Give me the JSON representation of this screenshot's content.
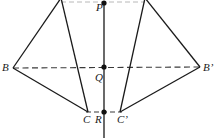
{
  "figure": {
    "type": "geometry-diagram",
    "width": 217,
    "height": 138,
    "background_color": "#ffffff",
    "stroke_color": "#1a1a1a",
    "dashed_color": "#3a3a3a",
    "faint_dashed_color": "#b8b8b8",
    "points": [
      {
        "name": "P",
        "label": "P",
        "x": 104,
        "y": 3,
        "marker": "filled-dot",
        "label_dx": -8,
        "label_dy": 0
      },
      {
        "name": "Q",
        "label": "Q",
        "x": 104,
        "y": 67,
        "marker": "filled-dot",
        "label_dx": -9,
        "label_dy": 6
      },
      {
        "name": "R",
        "label": "R",
        "x": 104,
        "y": 112,
        "marker": "filled-dot",
        "label_dx": -9,
        "label_dy": 3
      },
      {
        "name": "B",
        "label": "B",
        "x": 13,
        "y": 68,
        "marker": "none",
        "label_dx": -11,
        "label_dy": -5
      },
      {
        "name": "Bp",
        "label": "B’",
        "x": 200,
        "y": 67,
        "marker": "none",
        "label_dx": 4,
        "label_dy": -5
      },
      {
        "name": "C",
        "label": "C",
        "x": 88,
        "y": 112,
        "marker": "none",
        "label_dx": -5,
        "label_dy": 3
      },
      {
        "name": "Cp",
        "label": "C’",
        "x": 120,
        "y": 112,
        "marker": "none",
        "label_dx": -2,
        "label_dy": 3
      },
      {
        "name": "A",
        "label": "",
        "x": 61,
        "y": -2,
        "marker": "none",
        "label_dx": 0,
        "label_dy": 0
      },
      {
        "name": "Ap",
        "label": "",
        "x": 145,
        "y": -2,
        "marker": "none",
        "label_dx": 0,
        "label_dy": 0
      }
    ],
    "solid_segments": [
      {
        "name": "apex-left-to-B",
        "x1": 61,
        "y1": -2,
        "x2": 13,
        "y2": 68
      },
      {
        "name": "B-to-C",
        "x1": 13,
        "y1": 68,
        "x2": 88,
        "y2": 112
      },
      {
        "name": "C-to-apex-left",
        "x1": 88,
        "y1": 112,
        "x2": 61,
        "y2": -2
      },
      {
        "name": "apex-right-to-Bp",
        "x1": 145,
        "y1": -2,
        "x2": 200,
        "y2": 67
      },
      {
        "name": "Bp-to-Cp",
        "x1": 200,
        "y1": 67,
        "x2": 120,
        "y2": 112
      },
      {
        "name": "Cp-to-apex-right",
        "x1": 120,
        "y1": 112,
        "x2": 145,
        "y2": -2
      },
      {
        "name": "vertical-axis-PR",
        "x1": 104,
        "y1": 2,
        "x2": 104,
        "y2": 138
      }
    ],
    "dashed_segments": [
      {
        "name": "axis-B-to-Bprime",
        "x1": 13,
        "y1": 68,
        "x2": 200,
        "y2": 67
      },
      {
        "name": "axis-C-to-Cprime",
        "x1": 88,
        "y1": 112,
        "x2": 120,
        "y2": 112
      }
    ],
    "faint_dashed_segments": [
      {
        "name": "top-chord-apex-to-apex",
        "x1": 61,
        "y1": 2,
        "x2": 145,
        "y2": 2
      }
    ]
  }
}
